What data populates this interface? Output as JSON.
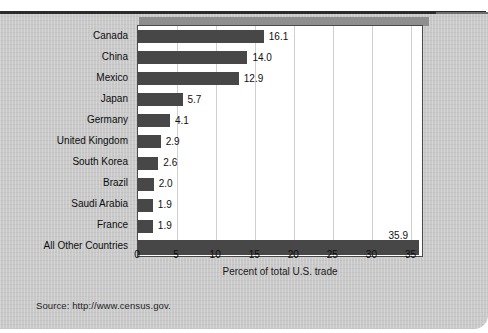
{
  "source_note": "Source: http://www.census.gov.",
  "chart_data": {
    "type": "bar",
    "orientation": "horizontal",
    "title": "",
    "xlabel": "Percent of total U.S. trade",
    "ylabel": "",
    "xlim": [
      0,
      36.6
    ],
    "xticks": [
      0,
      5,
      10,
      15,
      20,
      25,
      30,
      35
    ],
    "xtick_labels": [
      "0",
      "5",
      "10",
      "15",
      "20",
      "25",
      "30",
      "35"
    ],
    "grid": "vertical",
    "legend": "none",
    "bar_color": "#474747",
    "categories": [
      "Canada",
      "China",
      "Mexico",
      "Japan",
      "Germany",
      "United Kingdom",
      "South Korea",
      "Brazil",
      "Saudi Arabia",
      "France",
      "All Other Countries"
    ],
    "values": [
      16.1,
      14.0,
      12.9,
      5.7,
      4.1,
      2.9,
      2.6,
      2.0,
      1.9,
      1.9,
      35.9
    ],
    "value_labels": [
      "16.1",
      "14.0",
      "12.9",
      "5.7",
      "4.1",
      "2.9",
      "2.6",
      "2.0",
      "1.9",
      "1.9",
      "35.9"
    ],
    "value_label_position": [
      "right",
      "right",
      "right",
      "right",
      "right",
      "right",
      "right",
      "right",
      "right",
      "right",
      "above"
    ]
  }
}
